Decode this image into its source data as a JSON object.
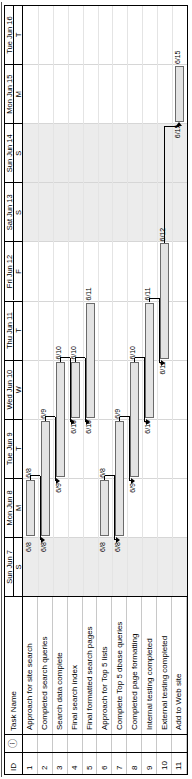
{
  "table": {
    "columns": [
      "ID",
      "indicator",
      "Task Name"
    ],
    "id_header": "ID",
    "indicator_header": "ⓘ",
    "task_header": "Task Name",
    "rows": [
      {
        "id": "1",
        "name": "Approach for site search"
      },
      {
        "id": "2",
        "name": "Completed search queries"
      },
      {
        "id": "3",
        "name": "Search data complete"
      },
      {
        "id": "4",
        "name": "Final search index"
      },
      {
        "id": "5",
        "name": "Final formatted search pages"
      },
      {
        "id": "6",
        "name": "Approach for Top 5 lists"
      },
      {
        "id": "7",
        "name": "Complete Top 5 dbase queries"
      },
      {
        "id": "8",
        "name": "Completed page formatting"
      },
      {
        "id": "9",
        "name": "Internal testing completed"
      },
      {
        "id": "10",
        "name": "External testing completed"
      },
      {
        "id": "11",
        "name": "Add to Web site"
      }
    ]
  },
  "timescale": {
    "days": [
      {
        "label": "Sun Jun 7",
        "initial": "S",
        "weekend": true
      },
      {
        "label": "Mon Jun 8",
        "initial": "M",
        "weekend": false
      },
      {
        "label": "Tue Jun 9",
        "initial": "T",
        "weekend": false
      },
      {
        "label": "Wed Jun 10",
        "initial": "W",
        "weekend": false
      },
      {
        "label": "Thu Jun 11",
        "initial": "T",
        "weekend": false
      },
      {
        "label": "Fri Jun 12",
        "initial": "F",
        "weekend": false
      },
      {
        "label": "Sat Jun 13",
        "initial": "S",
        "weekend": true
      },
      {
        "label": "Sun Jun 14",
        "initial": "S",
        "weekend": true
      },
      {
        "label": "Mon Jun 15",
        "initial": "M",
        "weekend": false
      },
      {
        "label": "Tue Jun 16",
        "initial": "T",
        "weekend": false
      }
    ]
  },
  "chart_data": {
    "type": "bar",
    "title": "",
    "xlabel": "",
    "ylabel": "",
    "orientation": "gantt",
    "date_axis": [
      "Sun Jun 7",
      "Mon Jun 8",
      "Tue Jun 9",
      "Wed Jun 10",
      "Thu Jun 11",
      "Fri Jun 12",
      "Sat Jun 13",
      "Sun Jun 14",
      "Mon Jun 15",
      "Tue Jun 16"
    ],
    "categories": [
      "Approach for site search",
      "Completed search queries",
      "Search data complete",
      "Final search index",
      "Final formatted search pages",
      "Approach for Top 5 lists",
      "Complete Top 5 dbase queries",
      "Completed page formatting",
      "Internal testing completed",
      "External testing completed",
      "Add to Web site"
    ],
    "tasks": [
      {
        "id": "1",
        "name": "Approach for site search",
        "start": "6/8",
        "finish": "6/8",
        "start_label": "6/8",
        "finish_label": "6/8",
        "start_day_index": 1,
        "span_days": 1
      },
      {
        "id": "2",
        "name": "Completed search queries",
        "start": "6/8",
        "finish": "6/9",
        "start_label": "6/8",
        "finish_label": "6/9",
        "start_day_index": 1,
        "span_days": 2
      },
      {
        "id": "3",
        "name": "Search data complete",
        "start": "6/9",
        "finish": "6/10",
        "start_label": "6/9",
        "finish_label": "6/10",
        "start_day_index": 2,
        "span_days": 2
      },
      {
        "id": "4",
        "name": "Final search index",
        "start": "6/10",
        "finish": "6/10",
        "start_label": "6/10",
        "finish_label": "6/10",
        "start_day_index": 3,
        "span_days": 1
      },
      {
        "id": "5",
        "name": "Final formatted search pages",
        "start": "6/10",
        "finish": "6/11",
        "start_label": "6/10",
        "finish_label": "6/11",
        "start_day_index": 3,
        "span_days": 2
      },
      {
        "id": "6",
        "name": "Approach for Top 5 lists",
        "start": "6/8",
        "finish": "6/8",
        "start_label": "6/8",
        "finish_label": "6/8",
        "start_day_index": 1,
        "span_days": 1
      },
      {
        "id": "7",
        "name": "Complete Top 5 dbase queries",
        "start": "6/8",
        "finish": "6/9",
        "start_label": "6/8",
        "finish_label": "6/9",
        "start_day_index": 1,
        "span_days": 2
      },
      {
        "id": "8",
        "name": "Completed page formatting",
        "start": "6/9",
        "finish": "6/10",
        "start_label": "6/9",
        "finish_label": "6/10",
        "start_day_index": 2,
        "span_days": 2
      },
      {
        "id": "9",
        "name": "Internal testing completed",
        "start": "6/10",
        "finish": "6/11",
        "start_label": "6/10",
        "finish_label": "6/11",
        "start_day_index": 3,
        "span_days": 2
      },
      {
        "id": "10",
        "name": "External testing completed",
        "start": "6/11",
        "finish": "6/12",
        "start_label": "6/11",
        "finish_label": "6/12",
        "start_day_index": 4,
        "span_days": 2
      },
      {
        "id": "11",
        "name": "Add to Web site",
        "start": "6/15",
        "finish": "6/15",
        "start_label": "6/15",
        "finish_label": "6/15",
        "start_day_index": 8,
        "span_days": 1
      }
    ],
    "dependencies": [
      {
        "from": "1",
        "to": "2"
      },
      {
        "from": "2",
        "to": "3"
      },
      {
        "from": "3",
        "to": "4"
      },
      {
        "from": "4",
        "to": "5"
      },
      {
        "from": "6",
        "to": "7"
      },
      {
        "from": "7",
        "to": "8"
      },
      {
        "from": "8",
        "to": "9"
      },
      {
        "from": "9",
        "to": "10"
      },
      {
        "from": "10",
        "to": "11"
      }
    ]
  },
  "colors": {
    "bar_fill": "#e3e3e3",
    "bar_border": "#6b6b6b",
    "weekend_shade": "#ececec",
    "grid": "#d6d6d6",
    "text": "#000000"
  }
}
